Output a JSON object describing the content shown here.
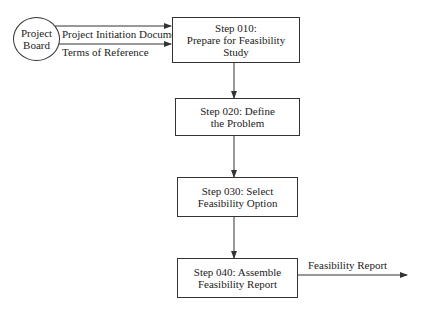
{
  "diagram": {
    "external_entity": {
      "line1": "Project",
      "line2": "Board"
    },
    "inputs": [
      {
        "label": "Project Initiation Document"
      },
      {
        "label": "Terms of Reference"
      }
    ],
    "steps": [
      {
        "line1": "Step 010:",
        "line2": "Prepare for Feasibility Study"
      },
      {
        "line1": "Step 020: Define",
        "line2": "the Problem"
      },
      {
        "line1": "Step 030: Select",
        "line2": "Feasibility Option"
      },
      {
        "line1": "Step 040: Assemble",
        "line2": "Feasibility Report"
      }
    ],
    "output": {
      "label": "Feasibility Report"
    },
    "colors": {
      "line": "#333333",
      "background": "#ffffff"
    }
  }
}
